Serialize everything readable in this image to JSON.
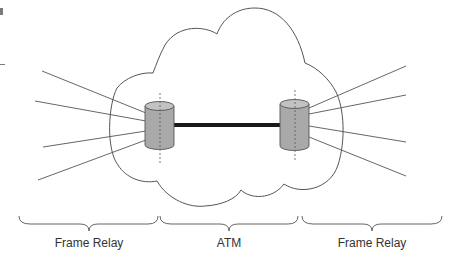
{
  "diagram": {
    "segments": [
      {
        "id": "left",
        "label": "Frame Relay",
        "center_x": 89
      },
      {
        "id": "middle",
        "label": "ATM",
        "center_x": 229
      },
      {
        "id": "right",
        "label": "Frame Relay",
        "center_x": 372
      }
    ],
    "nodes": [
      {
        "id": "left-switch",
        "type": "cylinder",
        "center_x": 160
      },
      {
        "id": "right-switch",
        "type": "cylinder",
        "center_x": 295
      }
    ],
    "trunk": {
      "from": "left-switch",
      "to": "right-switch"
    },
    "colors": {
      "stroke": "#555555",
      "cylinder_fill": "#a9a9a9",
      "cylinder_top": "#c2c2c2",
      "trunk": "#1a1a1a",
      "text": "#333333"
    }
  }
}
